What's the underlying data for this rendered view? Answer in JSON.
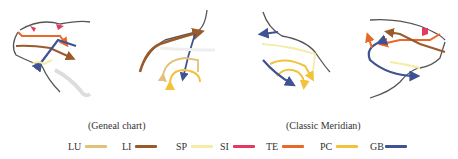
{
  "captions": {
    "left": "(Geneal chart)",
    "right": "(Classic Meridian)"
  },
  "legend": [
    {
      "label": "LU",
      "color": "#e2c27a"
    },
    {
      "label": "LI",
      "color": "#9a5a2a"
    },
    {
      "label": "SP",
      "color": "#f5eca8"
    },
    {
      "label": "SI",
      "color": "#e23a60"
    },
    {
      "label": "TE",
      "color": "#e8682a"
    },
    {
      "label": "PC",
      "color": "#f2c23a"
    },
    {
      "label": "GB",
      "color": "#3f5393"
    }
  ],
  "colors": {
    "outline": "#555555",
    "LU": "#e2c27a",
    "LI": "#9a5a2a",
    "SP": "#f5eca8",
    "SI": "#e23a60",
    "TE": "#e8682a",
    "PC": "#f2c23a",
    "GB": "#3f5393"
  }
}
